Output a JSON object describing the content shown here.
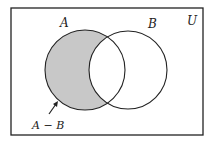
{
  "diagram": {
    "type": "venn",
    "universe_label": "U",
    "sets": [
      {
        "id": "A",
        "label": "A"
      },
      {
        "id": "B",
        "label": "B"
      }
    ],
    "shaded_region": "A - B",
    "annotation": {
      "text": "A − B",
      "points_to": "shaded region of A outside B"
    },
    "colors": {
      "stroke": "#222222",
      "shade": "#c8c8c8",
      "background": "#ffffff"
    }
  }
}
